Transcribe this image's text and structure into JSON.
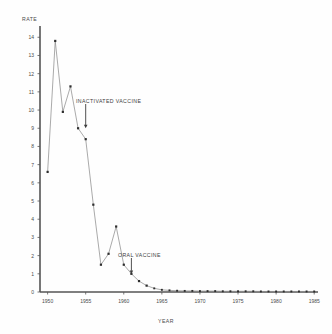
{
  "chart_data": {
    "type": "line",
    "title": "",
    "xlabel": "YEAR",
    "ylabel": "RATE",
    "xlim": [
      1949,
      1985.5
    ],
    "ylim": [
      0,
      14.4
    ],
    "grid": false,
    "legend_position": "none",
    "xticks": [
      "1950",
      "1955",
      "1960",
      "1965",
      "1970",
      "1975",
      "1980",
      "1985"
    ],
    "xtick_values": [
      1950,
      1955,
      1960,
      1965,
      1970,
      1975,
      1980,
      1985
    ],
    "yticks": [
      "0",
      "1",
      "2",
      "3",
      "4",
      "5",
      "6",
      "7",
      "8",
      "9",
      "10",
      "11",
      "12",
      "13",
      "14"
    ],
    "ytick_values": [
      0,
      1,
      2,
      3,
      4,
      5,
      6,
      7,
      8,
      9,
      10,
      11,
      12,
      13,
      14
    ],
    "x": [
      1950,
      1951,
      1952,
      1953,
      1954,
      1955,
      1956,
      1957,
      1958,
      1959,
      1960,
      1961,
      1962,
      1963,
      1964,
      1965,
      1966,
      1967,
      1968,
      1969,
      1970,
      1971,
      1972,
      1973,
      1974,
      1975,
      1976,
      1977,
      1978,
      1979,
      1980,
      1981,
      1982,
      1983,
      1984,
      1985
    ],
    "values": [
      6.6,
      13.8,
      9.9,
      11.3,
      9.0,
      8.4,
      4.8,
      1.5,
      2.1,
      3.6,
      1.5,
      1.0,
      0.6,
      0.35,
      0.2,
      0.12,
      0.09,
      0.07,
      0.06,
      0.06,
      0.05,
      0.05,
      0.05,
      0.04,
      0.04,
      0.04,
      0.04,
      0.04,
      0.03,
      0.03,
      0.03,
      0.03,
      0.03,
      0.03,
      0.03,
      0.03
    ],
    "series": [
      {
        "name": "Poliomyelitis rate",
        "values": [
          6.6,
          13.8,
          9.9,
          11.3,
          9.0,
          8.4,
          4.8,
          1.5,
          2.1,
          3.6,
          1.5,
          1.0,
          0.6,
          0.35,
          0.2,
          0.12,
          0.09,
          0.07,
          0.06,
          0.06,
          0.05,
          0.05,
          0.05,
          0.04,
          0.04,
          0.04,
          0.04,
          0.04,
          0.03,
          0.03,
          0.03,
          0.03,
          0.03,
          0.03,
          0.03,
          0.03
        ]
      }
    ],
    "annotations": [
      {
        "text": "INACTIVATED VACCINE",
        "x": 1955,
        "y": 9.0
      },
      {
        "text": "ORAL VACCINE",
        "x": 1961,
        "y": 1.0
      }
    ],
    "line_color": "#8d8d8d",
    "marker_color": "#2e2e2e",
    "axis_color": "#555555"
  }
}
